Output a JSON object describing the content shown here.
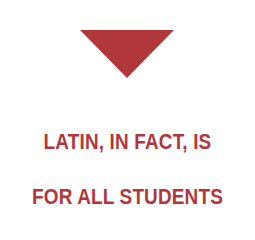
{
  "graphic": {
    "shape": "downward-triangle",
    "color": "#b2373b"
  },
  "text": {
    "line1": "LATIN, IN FACT, IS",
    "line2": "FOR ALL STUDENTS",
    "color": "#b2373b"
  }
}
